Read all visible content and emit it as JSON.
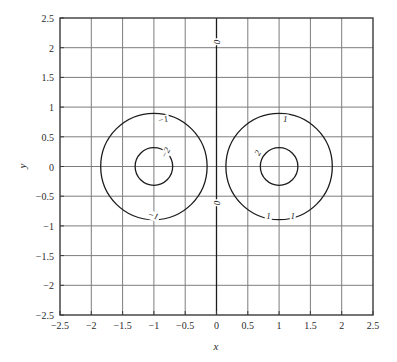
{
  "chart_data": {
    "type": "line",
    "title": "",
    "xlabel": "x",
    "ylabel": "y",
    "xlim": [
      -2.5,
      2.5
    ],
    "ylim": [
      -2.5,
      2.5
    ],
    "grid": true,
    "legend": "none",
    "xticks": [
      "-2.5",
      "-2",
      "-1.5",
      "-1",
      "-0.5",
      "0",
      "0.5",
      "1",
      "1.5",
      "2",
      "2.5"
    ],
    "xtick_values": [
      -2.5,
      -2,
      -1.5,
      -1,
      -0.5,
      0,
      0.5,
      1,
      1.5,
      2,
      2.5
    ],
    "yticks": [
      "-2.5",
      "-2",
      "-1.5",
      "-1",
      "-0.5",
      "0",
      "0.5",
      "1",
      "1.5",
      "2",
      "2.5"
    ],
    "ytick_values": [
      -2.5,
      -2,
      -1.5,
      -1,
      -0.5,
      0,
      0.5,
      1,
      1.5,
      2,
      2.5
    ],
    "contours": [
      {
        "level": "0",
        "shape": "vertical-line",
        "x": 0,
        "y_from": -2.5,
        "y_to": 2.5
      },
      {
        "level": "-1",
        "shape": "circle",
        "cx": -1,
        "cy": 0,
        "r": 0.85
      },
      {
        "level": "-2",
        "shape": "circle",
        "cx": -1,
        "cy": 0,
        "r": 0.3
      },
      {
        "level": "1",
        "shape": "circle",
        "cx": 1,
        "cy": 0,
        "r": 0.85
      },
      {
        "level": "2",
        "shape": "circle",
        "cx": 1,
        "cy": 0,
        "r": 0.3
      }
    ],
    "contour_labels": [
      {
        "text": "0",
        "x": 0.0,
        "y": 2.1,
        "rotation": -90
      },
      {
        "text": "0",
        "x": 0.0,
        "y": -0.62,
        "rotation": -90
      },
      {
        "text": "-1",
        "x": -0.86,
        "y": 0.79,
        "rotation": -16
      },
      {
        "text": "-1",
        "x": -1.02,
        "y": -0.83,
        "rotation": 18
      },
      {
        "text": "-2",
        "x": -0.8,
        "y": 0.23,
        "rotation": -62
      },
      {
        "text": "1",
        "x": 1.1,
        "y": 0.8,
        "rotation": 0
      },
      {
        "text": "1",
        "x": 0.83,
        "y": -0.83,
        "rotation": 0
      },
      {
        "text": "1",
        "x": 1.22,
        "y": -0.83,
        "rotation": 0
      },
      {
        "text": "2",
        "x": 0.66,
        "y": 0.22,
        "rotation": -62
      }
    ]
  },
  "style": {
    "axis_color": "#3a3a3a",
    "grid_color": "#7d7d7d",
    "contour_color": "#1c1c1c",
    "text_color": "#2b2b2b",
    "background": "#ffffff"
  }
}
